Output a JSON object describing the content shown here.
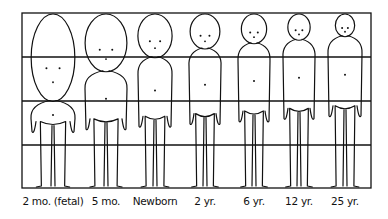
{
  "grid": {
    "rows": 4,
    "columns": 7
  },
  "figures": [
    {
      "label": "2 mo. (fetal)",
      "head_fraction": 0.5
    },
    {
      "label": "5 mo.",
      "head_fraction": 0.33
    },
    {
      "label": "Newborn",
      "head_fraction": 0.25
    },
    {
      "label": "2 yr.",
      "head_fraction": 0.2
    },
    {
      "label": "6 yr.",
      "head_fraction": 0.17
    },
    {
      "label": "12 yr.",
      "head_fraction": 0.15
    },
    {
      "label": "25 yr.",
      "head_fraction": 0.13
    }
  ],
  "colors": {
    "ink": "#111111",
    "paper": "#ffffff"
  }
}
